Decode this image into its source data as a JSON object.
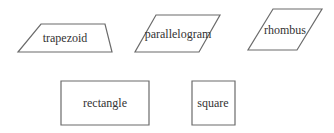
{
  "diagram": {
    "stroke_color": "#6b6b6b",
    "text_color": "#333333",
    "background": "#ffffff",
    "shapes": [
      {
        "id": "trapezoid",
        "label": "trapezoid",
        "points": "41,24 105,24 112,52 18,52",
        "label_x": 65,
        "label_y": 38
      },
      {
        "id": "parallelogram",
        "label": "parallelogram",
        "points": "156,15 220,15 199,52 135,52",
        "label_x": 178,
        "label_y": 34
      },
      {
        "id": "rhombus",
        "label": "rhombus",
        "points": "273,9 322,9 297,50 248,50",
        "label_x": 285,
        "label_y": 30
      },
      {
        "id": "rectangle",
        "label": "rectangle",
        "points": "61,81 149,81 149,125 61,125",
        "label_x": 105,
        "label_y": 103
      },
      {
        "id": "square",
        "label": "square",
        "points": "192,81 235,81 235,125 192,125",
        "label_x": 213,
        "label_y": 103
      }
    ]
  }
}
